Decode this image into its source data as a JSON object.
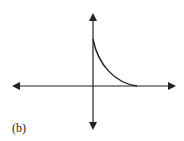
{
  "figure": {
    "label": "(b)",
    "axes": {
      "x_axis": "horizontal double-headed arrow",
      "y_axis": "vertical double-headed arrow"
    },
    "curve": {
      "shape": "decreasing, concave up",
      "start": "on positive y-axis",
      "end": "touches positive x-axis"
    },
    "colors": {
      "stroke": "#222222",
      "background": "#ffffff"
    }
  }
}
